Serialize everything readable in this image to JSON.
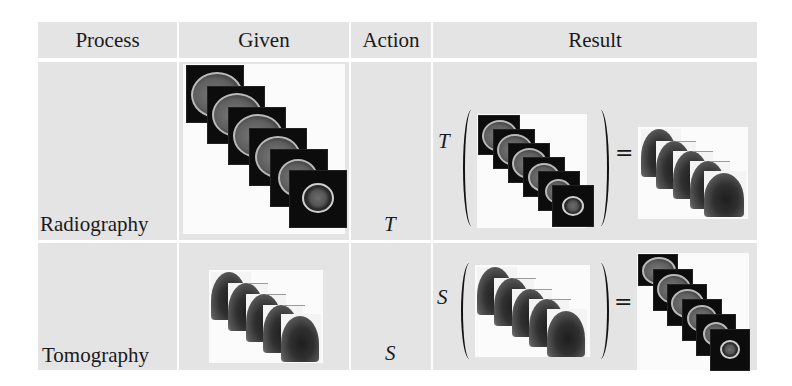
{
  "table": {
    "headers": [
      "Process",
      "Given",
      "Action",
      "Result"
    ],
    "rows": [
      {
        "process": "Radiography",
        "given": "stack of 6 axial brain MRI slices",
        "action": "T",
        "result": {
          "operator": "T",
          "input": "stack of 6 axial brain MRI slices",
          "equals": "=",
          "output": "stack of 5 projection radiographs of head"
        }
      },
      {
        "process": "Tomography",
        "given": "stack of 5 projection radiographs of head",
        "action": "S",
        "result": {
          "operator": "S",
          "input": "stack of 5 projection radiographs of head",
          "equals": "=",
          "output": "stack of 6 axial brain MRI slices"
        }
      }
    ]
  },
  "colors": {
    "cell_background": "#e4e4e4",
    "grid_line": "#ffffff",
    "image_background": "#fbfbfb",
    "slice_background": "#0c0c0c"
  }
}
